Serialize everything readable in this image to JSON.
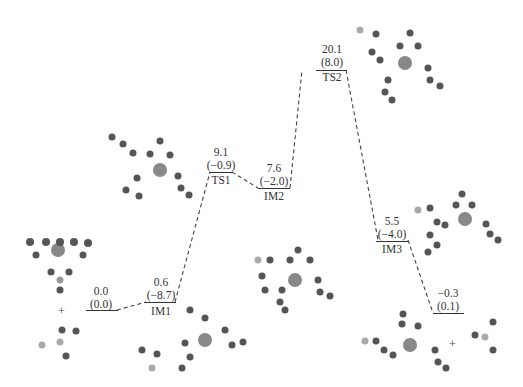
{
  "diagram": {
    "type": "energy-profile",
    "points": [
      {
        "id": "R",
        "name": "",
        "value": "0.0",
        "value2": "(0.0)"
      },
      {
        "id": "IM1",
        "name": "IM1",
        "value": "0.6",
        "value2": "(−8.7)"
      },
      {
        "id": "TS1",
        "name": "TS1",
        "value": "9.1",
        "value2": "(−0.9)"
      },
      {
        "id": "IM2",
        "name": "IM2",
        "value": "7.6",
        "value2": "(−2.0)"
      },
      {
        "id": "TS2",
        "name": "TS2",
        "value": "20.1",
        "value2": "(8.0)"
      },
      {
        "id": "IM3",
        "name": "IM3",
        "value": "5.5",
        "value2": "(−4.0)"
      },
      {
        "id": "P",
        "name": "",
        "value": "−0.3",
        "value2": "(0.1)"
      }
    ],
    "plus_signs": [
      "+",
      "+"
    ]
  }
}
